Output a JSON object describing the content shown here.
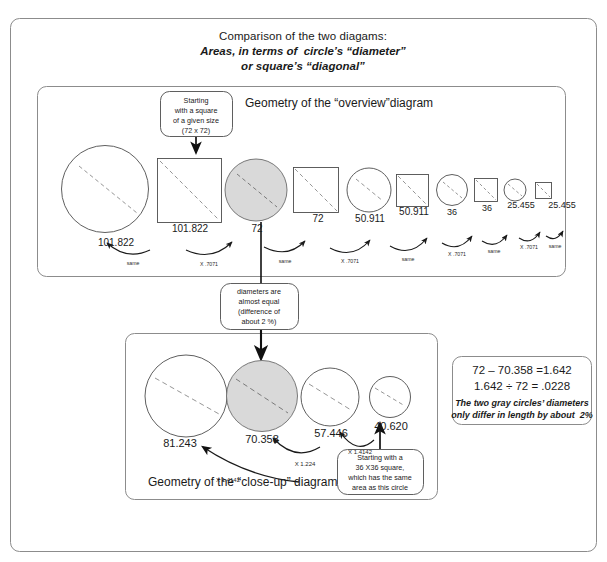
{
  "figure": {
    "title_line_1": "Comparison of the two diagams:",
    "title_line_2": "Areas, in terms of  circle’s “diameter”",
    "title_line_3": "or square’s “diagonal”",
    "outer_border_color": "#8c8c8c",
    "panel_border_color": "#8c8c8c",
    "gray_fill": "#d9d9d9",
    "stroke_color": "#4d4d4d",
    "arrow_color": "#1a1a1a"
  },
  "overview_panel": {
    "title": "Geometry of the “overview”diagram",
    "callout_start": {
      "lines": [
        "Starting",
        "with a square",
        "of a given size",
        "(72 x 72)"
      ]
    },
    "shapes": [
      {
        "kind": "circle",
        "value": "101.822",
        "size": 87,
        "fill": "none"
      },
      {
        "kind": "square",
        "value": "101.822",
        "size": 64,
        "fill": "none"
      },
      {
        "kind": "circle",
        "value": "72",
        "size": 62,
        "fill": "gray"
      },
      {
        "kind": "square",
        "value": "72",
        "size": 45,
        "fill": "none"
      },
      {
        "kind": "circle",
        "value": "50.911",
        "size": 44,
        "fill": "none"
      },
      {
        "kind": "square",
        "value": "50.911",
        "size": 32,
        "fill": "none"
      },
      {
        "kind": "circle",
        "value": "36",
        "size": 31,
        "fill": "none"
      },
      {
        "kind": "square",
        "value": "36",
        "size": 23,
        "fill": "none"
      },
      {
        "kind": "circle",
        "value": "25.455",
        "size": 22,
        "fill": "none"
      },
      {
        "kind": "square",
        "value": "25.455",
        "size": 16,
        "fill": "none"
      }
    ],
    "arrow_labels": [
      "same",
      "X .7071",
      "same",
      "X .7071",
      "same",
      "X .7071",
      "same",
      "X .7071",
      "same"
    ]
  },
  "middle_callout": {
    "lines": [
      "diameters are",
      "almost equal",
      "(difference of",
      "about 2 %)"
    ]
  },
  "closeup_panel": {
    "title": "Geometry of the “close-up” diagram",
    "shapes": [
      {
        "kind": "circle",
        "value": "81.243",
        "size": 82,
        "fill": "none"
      },
      {
        "kind": "circle",
        "value": "70.358",
        "size": 71,
        "fill": "gray"
      },
      {
        "kind": "circle",
        "value": "57.446",
        "size": 58,
        "fill": "none"
      },
      {
        "kind": "circle",
        "value": "40.620",
        "size": 41,
        "fill": "none"
      }
    ],
    "arrow_labels": [
      "X 1.4142",
      "X 1.224",
      "X 1.4142"
    ],
    "callout_start": {
      "lines": [
        "Starting with a",
        "36 X36 square,",
        "which has the same",
        "area as this circle"
      ]
    }
  },
  "calc_box": {
    "line_1": "72 – 70.358 =1.642",
    "line_2": "1.642 ÷ 72 = .0228",
    "note_line_1": "The two gray circles’ diameters",
    "note_line_2": "only differ in length by about  2%"
  }
}
